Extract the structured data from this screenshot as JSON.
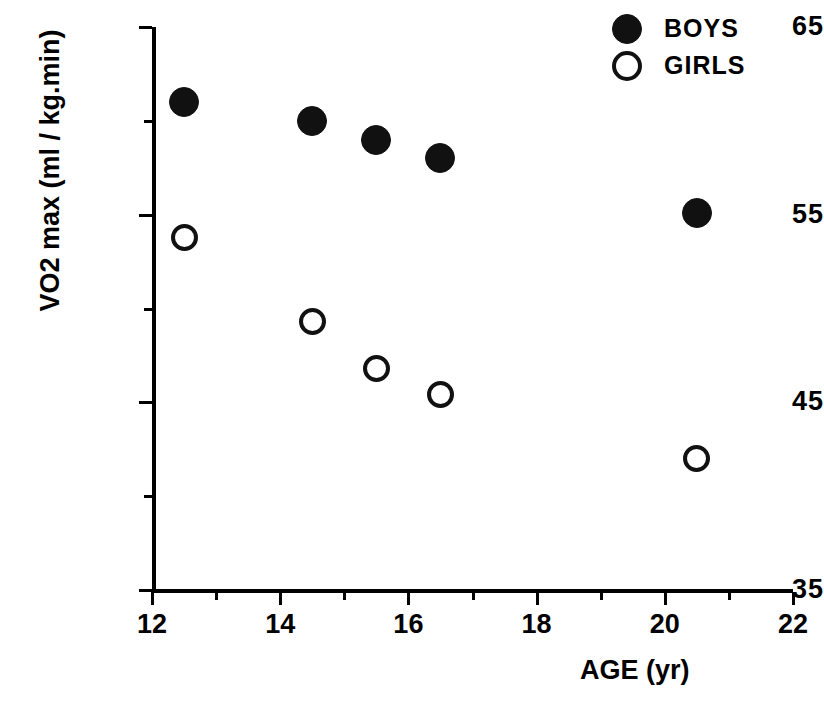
{
  "chart_data": {
    "type": "scatter",
    "title": "",
    "xlabel": "AGE  (yr)",
    "ylabel": "VO2 max (ml / kg.min)",
    "xlim": [
      12,
      22
    ],
    "ylim": [
      35,
      65
    ],
    "grid": false,
    "legend_position": "top-right",
    "xticks": [
      12,
      14,
      16,
      18,
      20,
      22
    ],
    "xtick_labels": [
      "12",
      "14",
      "16",
      "18",
      "20",
      "22"
    ],
    "xminor_ticks": [
      13,
      15,
      17,
      19,
      21
    ],
    "yticks": [
      35,
      45,
      55,
      65
    ],
    "ytick_labels": [
      "35",
      "45",
      "55",
      "65"
    ],
    "yminor_ticks": [
      40,
      50,
      60
    ],
    "series": [
      {
        "name": "BOYS",
        "marker": "filled-circle",
        "color": "#111111",
        "points": [
          {
            "x": 12.5,
            "y": 61.0
          },
          {
            "x": 14.5,
            "y": 60.0
          },
          {
            "x": 15.5,
            "y": 59.0
          },
          {
            "x": 16.5,
            "y": 58.0
          },
          {
            "x": 20.5,
            "y": 55.1
          }
        ]
      },
      {
        "name": "GIRLS",
        "marker": "open-circle",
        "color": "#111111",
        "points": [
          {
            "x": 12.5,
            "y": 53.8
          },
          {
            "x": 14.5,
            "y": 49.3
          },
          {
            "x": 15.5,
            "y": 46.8
          },
          {
            "x": 16.5,
            "y": 45.4
          },
          {
            "x": 20.5,
            "y": 42.0
          }
        ]
      }
    ]
  },
  "legend": {
    "items": [
      {
        "label": "BOYS",
        "marker": "filled-circle"
      },
      {
        "label": "GIRLS",
        "marker": "open-circle"
      }
    ]
  },
  "axes": {
    "x_title": "AGE  (yr)",
    "y_title": "VO2 max (ml / kg.min)"
  }
}
